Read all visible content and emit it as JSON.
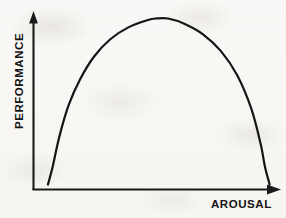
{
  "figure": {
    "name": "inverted-u-performance-arousal-curve",
    "background_color": "#f8f7f5",
    "ink_color": "#151515"
  },
  "axes": {
    "y": {
      "label": "PERFORMANCE",
      "has_arrowhead": true,
      "arrow_direction": "up",
      "label_orientation": "vertical-bottom-to-top"
    },
    "x": {
      "label": "AROUSAL",
      "has_arrowhead": true,
      "arrow_direction": "right",
      "label_orientation": "horizontal"
    }
  },
  "chart_data": {
    "type": "line",
    "title": "",
    "subtitle": "",
    "xlabel": "AROUSAL",
    "ylabel": "PERFORMANCE",
    "xlim": [
      0,
      100
    ],
    "ylim": [
      0,
      100
    ],
    "grid": false,
    "legend": "none",
    "tick_labels": {
      "x": [],
      "y": []
    },
    "annotations": [],
    "series": [
      {
        "name": "Performance vs Arousal (inverted-U)",
        "color": "#151515",
        "line_width": 2.2,
        "x": [
          3,
          5,
          8,
          12,
          17,
          23,
          30,
          38,
          46,
          50,
          55,
          62,
          70,
          78,
          85,
          91,
          95,
          97,
          99
        ],
        "values": [
          2,
          12,
          30,
          48,
          63,
          76,
          86,
          93,
          97,
          98,
          98,
          95,
          89,
          79,
          65,
          46,
          26,
          12,
          2
        ]
      }
    ]
  }
}
